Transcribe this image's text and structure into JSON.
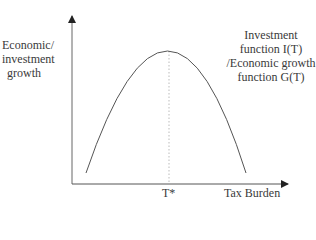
{
  "diagram": {
    "type": "laffer-style inverted-U curve",
    "y_axis_label": [
      "Economic/",
      "investment",
      "growth"
    ],
    "x_axis_label": "Tax Burden",
    "optimum_marker": "T*",
    "curve_label": [
      "Investment",
      "function I(T)",
      "/Economic growth",
      "function G(T)"
    ],
    "curve": {
      "shape": "inverted-parabola",
      "peak_at": "T*",
      "description": "Growth rises with tax burden up to T*, then falls"
    },
    "colors": {
      "axis": "#555555",
      "curve": "#555555",
      "guide": "#aaaaaa",
      "text": "#3a3a3a"
    }
  }
}
